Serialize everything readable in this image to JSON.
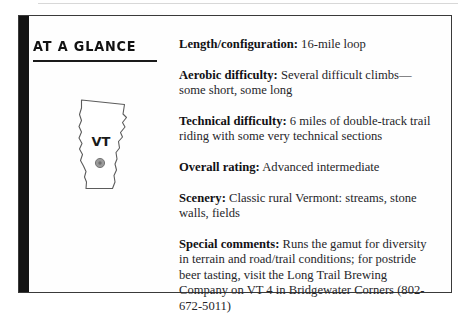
{
  "page": {
    "heading": "AT A GLANCE",
    "state_abbreviation": "VT",
    "map_marker": "trail-location-dot"
  },
  "details": [
    {
      "label": "Length/configuration:",
      "value": " 16-mile loop"
    },
    {
      "label": "Aerobic difficulty:",
      "value": " Several difficult climbs—some short, some long"
    },
    {
      "label": "Technical difficulty:",
      "value": " 6 miles of double-track trail riding with some very technical sections"
    },
    {
      "label": "Overall rating:",
      "value": " Advanced intermediate"
    },
    {
      "label": "Scenery:",
      "value": " Classic rural Vermont: streams, stone walls, fields"
    },
    {
      "label": "Special comments:",
      "value": " Runs the gamut for diversity in terrain and road/trail conditions; for postride beer tasting, visit the Long Trail Brewing Company on VT 4 in Bridgewater Corners (802-672-5011)"
    }
  ],
  "colors": {
    "bar": "#141414",
    "border": "#3a3a3a",
    "text": "#26262a",
    "marker": "#8a8a8a"
  }
}
